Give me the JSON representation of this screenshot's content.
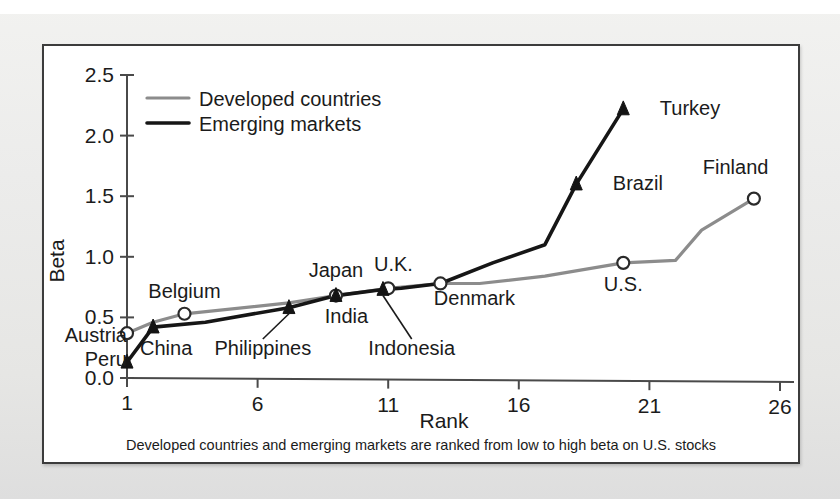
{
  "figure": {
    "caption": "Developed countries and emerging markets are ranked from low to high beta on U.S. stocks"
  },
  "chart_data": {
    "type": "line",
    "title": "",
    "xlabel": "Rank",
    "ylabel": "Beta",
    "xlim": [
      1,
      26
    ],
    "ylim": [
      0.0,
      2.5
    ],
    "xticks": [
      "1",
      "6",
      "11",
      "16",
      "21",
      "26"
    ],
    "xtick_values": [
      1,
      6,
      11,
      16,
      21,
      26
    ],
    "yticks": [
      "0.0",
      "0.5",
      "1.0",
      "1.5",
      "2.0",
      "2.5"
    ],
    "ytick_values": [
      0.0,
      0.5,
      1.0,
      1.5,
      2.0,
      2.5
    ],
    "grid": false,
    "legend_position": "top-left",
    "series": [
      {
        "name": "Developed countries",
        "color": "#8c8c8c",
        "marker": "open-circle",
        "x": [
          1,
          2,
          3.2,
          7.2,
          9,
          11,
          13,
          14.5,
          17,
          20,
          22,
          23,
          25
        ],
        "y": [
          0.37,
          0.46,
          0.53,
          0.62,
          0.68,
          0.74,
          0.78,
          0.78,
          0.84,
          0.95,
          0.97,
          1.22,
          1.48
        ]
      },
      {
        "name": "Emerging markets",
        "color": "#161616",
        "marker": "solid-triangle",
        "x": [
          1,
          2,
          4,
          7.2,
          9,
          10.8,
          11.5,
          13,
          15,
          17,
          18.2,
          20
        ],
        "y": [
          0.13,
          0.42,
          0.46,
          0.58,
          0.68,
          0.73,
          0.74,
          0.78,
          0.95,
          1.1,
          1.6,
          2.22
        ]
      }
    ],
    "annotations": [
      {
        "label": "Austria",
        "series": "Developed countries",
        "x": 1,
        "y": 0.37,
        "marker": "open-circle",
        "label_x": 1.0,
        "label_y": 0.3,
        "anchor": "end",
        "leader": false
      },
      {
        "label": "Belgium",
        "series": "Developed countries",
        "x": 3.2,
        "y": 0.53,
        "marker": "open-circle",
        "label_x": 3.2,
        "label_y": 0.66,
        "anchor": "middle",
        "leader": false
      },
      {
        "label": "Japan",
        "series": "Developed countries",
        "x": 9,
        "y": 0.68,
        "marker": "open-circle",
        "label_x": 9.0,
        "label_y": 0.83,
        "anchor": "middle",
        "leader": false
      },
      {
        "label": "U.K.",
        "series": "Developed countries",
        "x": 11,
        "y": 0.74,
        "marker": "open-circle",
        "label_x": 11.2,
        "label_y": 0.88,
        "anchor": "middle",
        "leader": false
      },
      {
        "label": "Denmark",
        "series": "Developed countries",
        "x": 13,
        "y": 0.78,
        "marker": "open-circle",
        "label_x": 14.3,
        "label_y": 0.6,
        "anchor": "middle",
        "leader": false
      },
      {
        "label": "U.S.",
        "series": "Developed countries",
        "x": 20,
        "y": 0.95,
        "marker": "open-circle",
        "label_x": 20.0,
        "label_y": 0.72,
        "anchor": "middle",
        "leader": false
      },
      {
        "label": "Finland",
        "series": "Developed countries",
        "x": 25,
        "y": 1.48,
        "marker": "open-circle",
        "label_x": 24.3,
        "label_y": 1.68,
        "anchor": "middle",
        "leader": false
      },
      {
        "label": "Peru",
        "series": "Emerging markets",
        "x": 1,
        "y": 0.13,
        "marker": "solid-triangle",
        "label_x": 1.0,
        "label_y": 0.1,
        "anchor": "end",
        "leader": false
      },
      {
        "label": "China",
        "series": "Emerging markets",
        "x": 2,
        "y": 0.42,
        "marker": "solid-triangle",
        "label_x": 2.5,
        "label_y": 0.19,
        "anchor": "middle",
        "leader": false
      },
      {
        "label": "Philippines",
        "series": "Emerging markets",
        "x": 7.2,
        "y": 0.58,
        "marker": "solid-triangle",
        "label_x": 6.2,
        "label_y": 0.19,
        "anchor": "middle",
        "leader": true
      },
      {
        "label": "India",
        "series": "Emerging markets",
        "x": 9,
        "y": 0.68,
        "marker": "solid-triangle",
        "label_x": 9.4,
        "label_y": 0.45,
        "anchor": "middle",
        "leader": false
      },
      {
        "label": "Indonesia",
        "series": "Emerging markets",
        "x": 10.8,
        "y": 0.73,
        "marker": "solid-triangle",
        "label_x": 11.9,
        "label_y": 0.19,
        "anchor": "middle",
        "leader": true
      },
      {
        "label": "Brazil",
        "series": "Emerging markets",
        "x": 18.2,
        "y": 1.6,
        "marker": "solid-triangle",
        "label_x": 19.6,
        "label_y": 1.55,
        "anchor": "start",
        "leader": false
      },
      {
        "label": "Turkey",
        "series": "Emerging markets",
        "x": 20,
        "y": 2.22,
        "marker": "solid-triangle",
        "label_x": 21.4,
        "label_y": 2.17,
        "anchor": "start",
        "leader": false
      }
    ]
  }
}
